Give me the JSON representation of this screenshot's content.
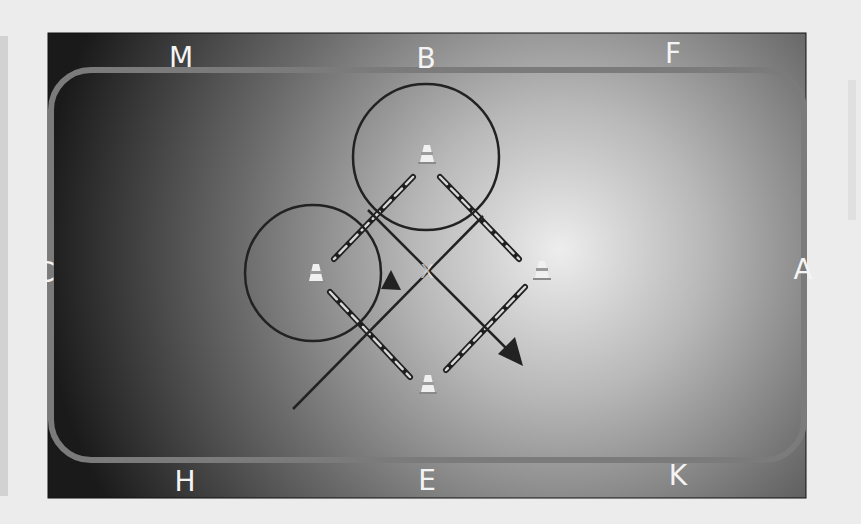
{
  "arena": {
    "letters": {
      "top": [
        "M",
        "B",
        "F"
      ],
      "left": "C",
      "right": "A",
      "bottom": [
        "H",
        "E",
        "K"
      ]
    },
    "center_marker": "X"
  },
  "exercise": {
    "cones": [
      "top",
      "left",
      "right",
      "bottom"
    ],
    "poles": 4,
    "circles": 2,
    "arrows": 2
  },
  "colors": {
    "arena_dark": "#141414",
    "arena_light": "#e6e6e6",
    "track": "#7b7b7b",
    "path": "#222222",
    "letter": "#f4f4f4",
    "background": "#ececec"
  }
}
